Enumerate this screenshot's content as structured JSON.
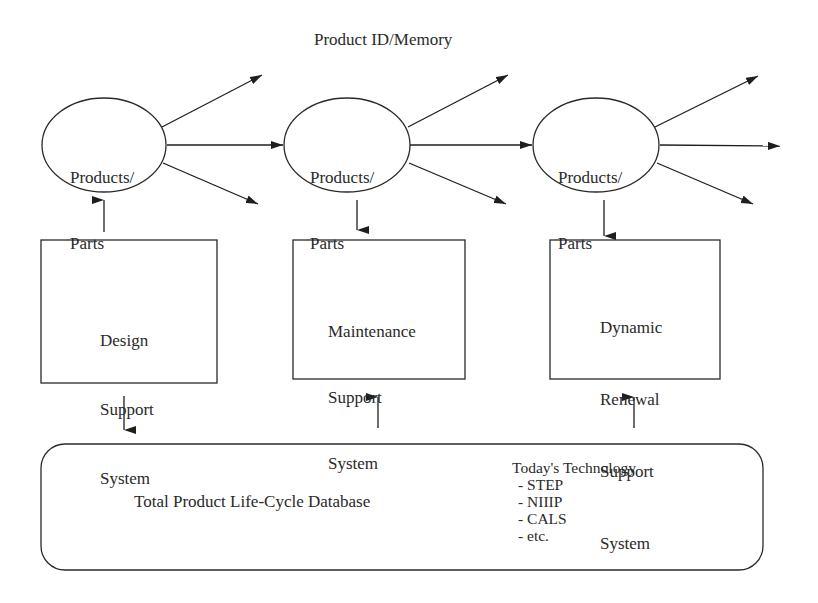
{
  "diagram": {
    "title": "Product ID/Memory",
    "nodes": [
      {
        "id": "parts-1",
        "shape": "ellipse",
        "line1": "Products/",
        "line2": "Parts"
      },
      {
        "id": "parts-2",
        "shape": "ellipse",
        "line1": "Products/",
        "line2": "Parts"
      },
      {
        "id": "parts-3",
        "shape": "ellipse",
        "line1": "Products/",
        "line2": "Parts"
      }
    ],
    "systems": [
      {
        "id": "design",
        "lines": [
          "Design",
          "Support",
          "System"
        ]
      },
      {
        "id": "maintenance",
        "lines": [
          "Maintenance",
          "Support",
          "System"
        ]
      },
      {
        "id": "dynamic-renewal",
        "lines": [
          "Dynamic",
          "Renewal",
          "Support",
          "System"
        ]
      }
    ],
    "database": {
      "label": "Total Product Life-Cycle Database",
      "tech_heading": "Today's Technology",
      "tech_items": [
        "- STEP",
        "- NIIIP",
        "- CALS",
        "- etc."
      ]
    },
    "edges": [
      {
        "from": "parts-1",
        "to": "parts-2",
        "type": "arrow"
      },
      {
        "from": "parts-2",
        "to": "parts-3",
        "type": "arrow"
      },
      {
        "from": "design",
        "to": "parts-1",
        "type": "arrow-up"
      },
      {
        "from": "parts-2",
        "to": "maintenance",
        "type": "arrow-down"
      },
      {
        "from": "parts-3",
        "to": "dynamic-renewal",
        "type": "arrow-down"
      },
      {
        "from": "design",
        "to": "database",
        "type": "arrow-down"
      },
      {
        "from": "database",
        "to": "maintenance",
        "type": "arrow-up"
      },
      {
        "from": "database",
        "to": "dynamic-renewal",
        "type": "arrow-up"
      }
    ],
    "colors": {
      "stroke": "#2a2a2a",
      "background": "#ffffff"
    }
  }
}
